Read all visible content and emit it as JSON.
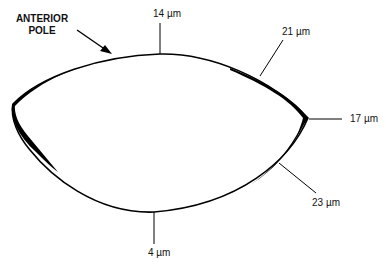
{
  "diagram": {
    "title_line1": "ANTERIOR",
    "title_line2": "POLE",
    "colors": {
      "stroke": "#000000",
      "background": "#ffffff",
      "text": "#111111"
    },
    "measurements": [
      {
        "id": "top",
        "label": "14 µm"
      },
      {
        "id": "upper-right",
        "label": "21 µm"
      },
      {
        "id": "right",
        "label": "17 µm"
      },
      {
        "id": "lower-right",
        "label": "23 µm"
      },
      {
        "id": "bottom",
        "label": "4 µm"
      }
    ]
  }
}
